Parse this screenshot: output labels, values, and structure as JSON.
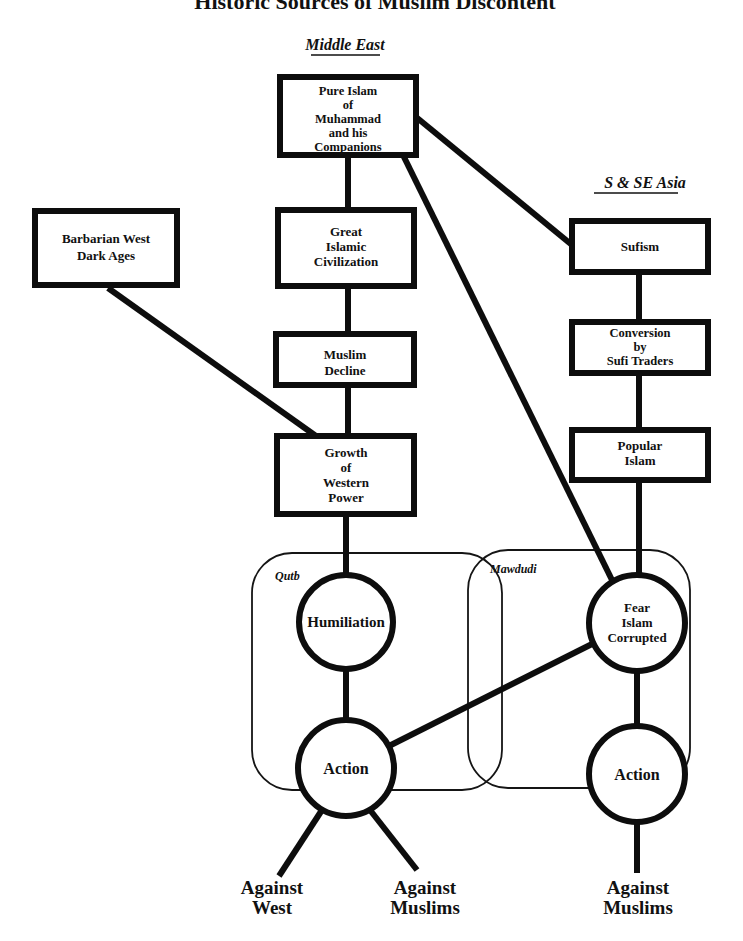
{
  "title": "Historic Sources of Muslim Discontent",
  "regions": {
    "middle_east": "Middle East",
    "south_asia": "S & SE Asia"
  },
  "groups": {
    "qutb": "Qutb",
    "mawdudi": "Mawdudi"
  },
  "nodes": {
    "pure_islam": [
      "Pure Islam",
      "of",
      "Muhammad",
      "and his",
      "Companions"
    ],
    "barbarian_west": [
      "Barbarian West",
      "Dark Ages"
    ],
    "great_civilization": [
      "Great",
      "Islamic",
      "Civilization"
    ],
    "muslim_decline": [
      "Muslim",
      "Decline"
    ],
    "western_power": [
      "Growth",
      "of",
      "Western",
      "Power"
    ],
    "sufism": [
      "Sufism"
    ],
    "sufi_traders": [
      "Conversion",
      "by",
      "Sufi Traders"
    ],
    "popular_islam": [
      "Popular",
      "Islam"
    ],
    "humiliation": [
      "Humiliation"
    ],
    "fear_corrupted": [
      "Fear",
      "Islam",
      "Corrupted"
    ],
    "action_left": [
      "Action"
    ],
    "action_right": [
      "Action"
    ]
  },
  "outcomes": {
    "against_west": [
      "Against",
      "West"
    ],
    "against_muslims_left": [
      "Against",
      "Muslims"
    ],
    "against_muslims_right": [
      "Against",
      "Muslims"
    ]
  },
  "colors": {
    "ink": "#0d0d0d",
    "background": "#ffffff"
  }
}
